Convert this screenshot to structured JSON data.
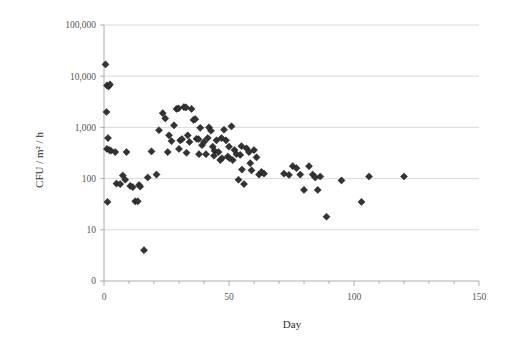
{
  "chart_data": {
    "type": "scatter",
    "title": "",
    "xlabel": "Day",
    "ylabel": "CFU / m² / h",
    "xlim": [
      0,
      150
    ],
    "ylim": [
      1,
      100000
    ],
    "yscale": "log",
    "grid": "horizontal",
    "legend": null,
    "x_ticks": [
      0,
      50,
      100,
      150
    ],
    "x_tick_labels": [
      "0",
      "50",
      "100",
      "150"
    ],
    "x_minor_tick_step": 10,
    "y_ticks": [
      100000,
      10000,
      1000,
      100,
      10,
      1
    ],
    "y_tick_labels": [
      "100,000",
      "10,000",
      "1,000",
      "100",
      "10",
      "0"
    ],
    "marker": "diamond",
    "marker_color": "#333333",
    "series": [
      {
        "name": "CFU measurements",
        "points": [
          [
            0.6,
            17000
          ],
          [
            1.2,
            6600
          ],
          [
            1.8,
            6300
          ],
          [
            2.4,
            6900
          ],
          [
            1.0,
            2000
          ],
          [
            1.6,
            620
          ],
          [
            1.2,
            380
          ],
          [
            2.2,
            360
          ],
          [
            2.8,
            350
          ],
          [
            1.4,
            35
          ],
          [
            4.5,
            330
          ],
          [
            5.0,
            80
          ],
          [
            6.5,
            78
          ],
          [
            7.5,
            115
          ],
          [
            8.5,
            95
          ],
          [
            9.0,
            330
          ],
          [
            10.5,
            72
          ],
          [
            11.5,
            68
          ],
          [
            12.5,
            36
          ],
          [
            13.5,
            36
          ],
          [
            14.0,
            75
          ],
          [
            14.5,
            70
          ],
          [
            16.0,
            4
          ],
          [
            17.5,
            105
          ],
          [
            19.0,
            340
          ],
          [
            21.0,
            120
          ],
          [
            22.0,
            880
          ],
          [
            23.5,
            1900
          ],
          [
            24.5,
            1500
          ],
          [
            25.5,
            330
          ],
          [
            26.0,
            700
          ],
          [
            27.0,
            540
          ],
          [
            28.0,
            1100
          ],
          [
            29.0,
            2300
          ],
          [
            29.8,
            2350
          ],
          [
            30.5,
            560
          ],
          [
            31.2,
            590
          ],
          [
            32.0,
            2500
          ],
          [
            32.8,
            2450
          ],
          [
            33.5,
            700
          ],
          [
            34.2,
            520
          ],
          [
            35.0,
            2300
          ],
          [
            35.8,
            1400
          ],
          [
            36.5,
            1450
          ],
          [
            37.0,
            600
          ],
          [
            37.8,
            590
          ],
          [
            38.5,
            980
          ],
          [
            39.2,
            450
          ],
          [
            40.0,
            520
          ],
          [
            40.8,
            300
          ],
          [
            41.5,
            620
          ],
          [
            42.0,
            1000
          ],
          [
            42.8,
            860
          ],
          [
            43.5,
            420
          ],
          [
            44.2,
            350
          ],
          [
            45.0,
            560
          ],
          [
            45.8,
            330
          ],
          [
            46.5,
            230
          ],
          [
            47.2,
            250
          ],
          [
            48.0,
            900
          ],
          [
            48.8,
            560
          ],
          [
            49.5,
            270
          ],
          [
            50.2,
            250
          ],
          [
            51.0,
            1050
          ],
          [
            51.5,
            230
          ],
          [
            52.2,
            360
          ],
          [
            53.0,
            300
          ],
          [
            53.8,
            95
          ],
          [
            54.5,
            290
          ],
          [
            55.2,
            150
          ],
          [
            56.0,
            78
          ],
          [
            57.0,
            390
          ],
          [
            58.0,
            330
          ],
          [
            59.0,
            145
          ],
          [
            60.0,
            360
          ],
          [
            61.0,
            260
          ],
          [
            62.0,
            120
          ],
          [
            63.0,
            135
          ],
          [
            64.0,
            125
          ],
          [
            30.0,
            380
          ],
          [
            33.0,
            320
          ],
          [
            38.0,
            300
          ],
          [
            44.0,
            280
          ],
          [
            47.0,
            620
          ],
          [
            50.0,
            420
          ],
          [
            55.0,
            430
          ],
          [
            58.5,
            200
          ],
          [
            72.0,
            125
          ],
          [
            74.0,
            118
          ],
          [
            75.5,
            175
          ],
          [
            77.0,
            160
          ],
          [
            78.5,
            120
          ],
          [
            80.0,
            60
          ],
          [
            82.0,
            175
          ],
          [
            83.5,
            120
          ],
          [
            84.5,
            105
          ],
          [
            85.5,
            60
          ],
          [
            86.5,
            110
          ],
          [
            89.0,
            18
          ],
          [
            95.0,
            92
          ],
          [
            103.0,
            35
          ],
          [
            106.0,
            110
          ],
          [
            120.0,
            110
          ]
        ]
      }
    ]
  },
  "axes": {
    "y_axis_title": "CFU / m² / h",
    "x_axis_title": "Day"
  }
}
